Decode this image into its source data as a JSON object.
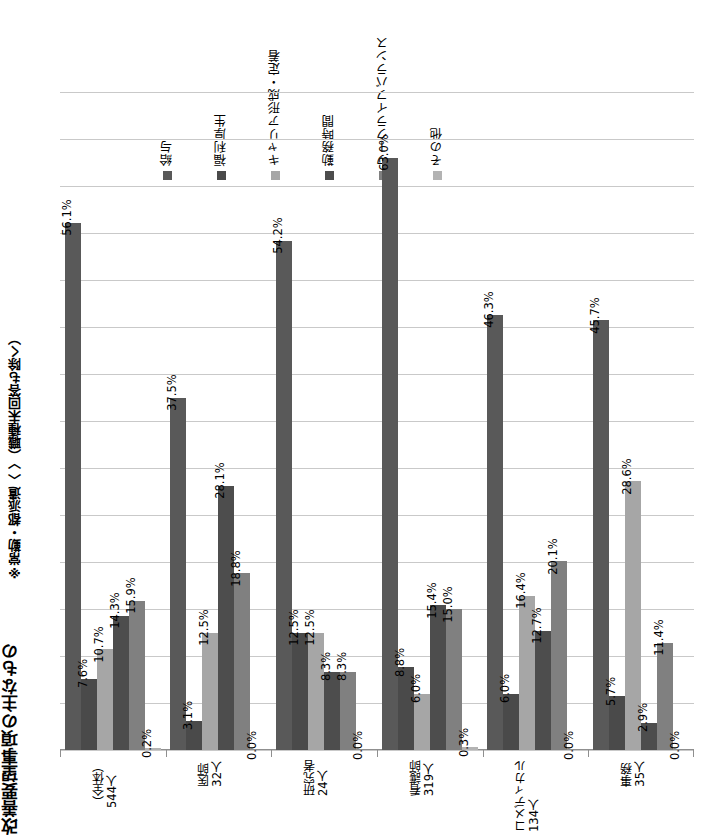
{
  "title": {
    "main": "改善要望事項の主なもの",
    "note": "※常勤・都派遣〈 〉（職種未回答も除く）"
  },
  "legend": {
    "position": "top",
    "items": [
      {
        "label": "給与",
        "color": "#595959"
      },
      {
        "label": "福利厚生",
        "color": "#4a4a4a"
      },
      {
        "label": "キャリア形成・定着",
        "color": "#a6a6a6"
      },
      {
        "label": "勤務時間",
        "color": "#4d4d4d"
      },
      {
        "label": "ワークライフバランス",
        "color": "#808080"
      },
      {
        "label": "その他",
        "color": "#b3b3b3"
      }
    ]
  },
  "chart_data": {
    "type": "bar",
    "title": "改善要望事項の主なもの",
    "xlabel": "",
    "ylabel": "",
    "ylim": [
      0,
      70
    ],
    "ytick_step": 5,
    "grid": true,
    "legend_position": "top",
    "value_format": "percent",
    "categories": [
      "（全体）544人",
      "医師 32人",
      "研究者 24人",
      "看護師 319人",
      "コメディカル 134人",
      "事務 35人"
    ],
    "category_lines": [
      [
        "（全体）",
        "544人"
      ],
      [
        "医師",
        "32人"
      ],
      [
        "研究者",
        "24人"
      ],
      [
        "看護師",
        "319人"
      ],
      [
        "コメディカル",
        "134人"
      ],
      [
        "事務",
        "35人"
      ]
    ],
    "series": [
      {
        "name": "給与",
        "color": "#595959",
        "values": [
          56.1,
          37.5,
          54.2,
          63.0,
          46.3,
          45.7
        ],
        "labels": [
          "56.1%",
          "37.5%",
          "54.2%",
          "63.0%",
          "46.3%",
          "45.7%"
        ]
      },
      {
        "name": "福利厚生",
        "color": "#4a4a4a",
        "values": [
          7.6,
          3.1,
          12.5,
          8.8,
          6.0,
          5.7
        ],
        "labels": [
          "7.6%",
          "3.1%",
          "12.5%",
          "8.8%",
          "6.0%",
          "5.7%"
        ]
      },
      {
        "name": "キャリア形成・定着",
        "color": "#a6a6a6",
        "values": [
          10.7,
          12.5,
          12.5,
          6.0,
          16.4,
          28.6
        ],
        "labels": [
          "10.7%",
          "12.5%",
          "12.5%",
          "6.0%",
          "16.4%",
          "28.6%"
        ]
      },
      {
        "name": "勤務時間",
        "color": "#4d4d4d",
        "values": [
          14.3,
          28.1,
          8.3,
          15.4,
          12.7,
          2.9
        ],
        "labels": [
          "14.3%",
          "28.1%",
          "8.3%",
          "15.4%",
          "12.7%",
          "2.9%"
        ]
      },
      {
        "name": "ワークライフバランス",
        "color": "#808080",
        "values": [
          15.9,
          18.8,
          8.3,
          15.0,
          20.1,
          11.4
        ],
        "labels": [
          "15.9%",
          "18.8%",
          "8.3%",
          "15.0%",
          "20.1%",
          "11.4%"
        ]
      },
      {
        "name": "その他",
        "color": "#b3b3b3",
        "values": [
          0.2,
          0.0,
          0.0,
          0.3,
          0.0,
          0.0
        ],
        "labels": [
          "0.2%",
          "0.0%",
          "0.0%",
          "0.3%",
          "0.0%",
          "0.0%"
        ]
      }
    ]
  }
}
